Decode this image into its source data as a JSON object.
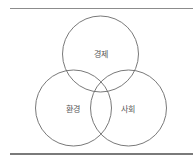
{
  "diagram": {
    "type": "venn",
    "sets": [
      {
        "id": "economy",
        "label": "경제"
      },
      {
        "id": "environment",
        "label": "환경"
      },
      {
        "id": "society",
        "label": "사회"
      }
    ],
    "colors": {
      "stroke": "#6a6a6a",
      "label": "#555555",
      "rule": "#8c8c8c"
    }
  }
}
